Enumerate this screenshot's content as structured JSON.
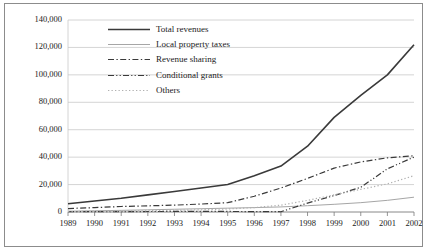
{
  "figure": {
    "background_color": "#ffffff",
    "frame_color": "#8c8c8c",
    "gridline_color": "#c9c9c9",
    "axis_color": "#7a7a7a",
    "text_color": "#1a1a1a"
  },
  "chart_data": {
    "type": "line",
    "title": "",
    "xlabel": "",
    "ylabel": "",
    "grid": true,
    "grid_axis": "y",
    "legend_position": "inside-top-left",
    "xlim": [
      1989,
      2002
    ],
    "ylim": [
      0,
      140000
    ],
    "ytick_values": [
      0,
      20000,
      40000,
      60000,
      80000,
      100000,
      120000,
      140000
    ],
    "ytick_labels": [
      "0",
      "20,000",
      "40,000",
      "60,000",
      "80,000",
      "100,000",
      "120,000",
      "140,000"
    ],
    "categories": [
      1989,
      1990,
      1991,
      1992,
      1993,
      1994,
      1995,
      1996,
      1997,
      1998,
      1999,
      2000,
      2001,
      2002
    ],
    "xtick_labels": [
      "1989",
      "1990",
      "1991",
      "1992",
      "1993",
      "1994",
      "1995",
      "1996",
      "1997",
      "1998",
      "1999",
      "2000",
      "2001",
      "2002"
    ],
    "series": [
      {
        "name": "Total revenues",
        "style": "solid",
        "color": "#3a3a3a",
        "width": 1.6,
        "values": [
          6000,
          8000,
          10000,
          12500,
          15000,
          17500,
          20000,
          26500,
          33500,
          48000,
          69000,
          85000,
          100000,
          122000
        ]
      },
      {
        "name": "Local property taxes",
        "style": "solid",
        "color": "#a6a6a6",
        "width": 1.0,
        "values": [
          600,
          900,
          1200,
          1600,
          2000,
          2400,
          2800,
          3200,
          3700,
          4600,
          5600,
          6800,
          8500,
          10800
        ]
      },
      {
        "name": "Revenue sharing",
        "style": "dashdot",
        "color": "#3a3a3a",
        "width": 1.2,
        "values": [
          2500,
          3200,
          4000,
          4500,
          5000,
          5800,
          6800,
          11500,
          17500,
          24500,
          32000,
          36500,
          39500,
          41000
        ]
      },
      {
        "name": "Conditional grants",
        "style": "dashdotdot",
        "color": "#3a3a3a",
        "width": 1.2,
        "values": [
          200,
          250,
          300,
          350,
          400,
          400,
          400,
          300,
          200,
          6500,
          12000,
          18000,
          31500,
          40000
        ]
      },
      {
        "name": "Others",
        "style": "dotted",
        "color": "#b0b0b0",
        "width": 1.2,
        "values": [
          300,
          500,
          700,
          900,
          1200,
          1600,
          2200,
          3200,
          5000,
          8500,
          12500,
          16500,
          20500,
          26500
        ]
      }
    ]
  },
  "legend": {
    "entries": [
      {
        "label": "Total revenues",
        "sample": "solid-dark-line-sample"
      },
      {
        "label": "Local property taxes",
        "sample": "solid-gray-line-sample"
      },
      {
        "label": "Revenue sharing",
        "sample": "dashdot-line-sample"
      },
      {
        "label": "Conditional grants",
        "sample": "dashdotdot-line-sample"
      },
      {
        "label": "Others",
        "sample": "dotted-line-sample"
      }
    ]
  }
}
